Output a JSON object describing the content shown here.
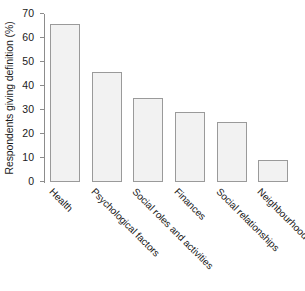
{
  "chart_data": {
    "type": "bar",
    "title": "",
    "xlabel": "",
    "ylabel": "Respondents giving definition (%)",
    "categories": [
      "Health",
      "Psychological factors",
      "Social roles and activities",
      "Finances",
      "Social relationships",
      "Neighbourhood"
    ],
    "values": [
      66,
      46,
      35,
      29,
      25,
      9
    ],
    "ylim": [
      0,
      70
    ],
    "yticks": [
      0,
      10,
      20,
      30,
      40,
      50,
      60,
      70
    ],
    "ytick_labels": [
      "0",
      "10",
      "20",
      "30",
      "40",
      "50",
      "60",
      "70"
    ],
    "grid": false,
    "legend": false,
    "bar_fill": "#f2f2f2",
    "bar_edge": "#9a9a9a",
    "axis_color": "#8c8c8c",
    "text_color": "#1a1a1a"
  }
}
